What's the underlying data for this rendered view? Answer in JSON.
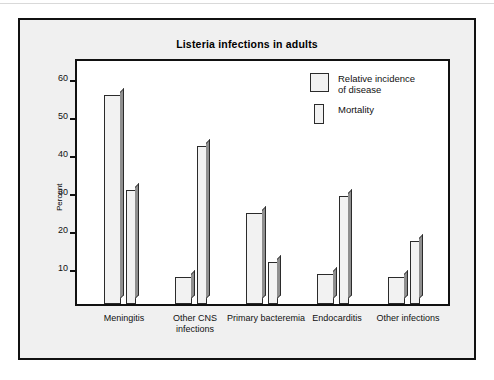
{
  "figure": {
    "title": "Listeria infections in adults"
  },
  "chart_data": {
    "type": "bar",
    "title": "Listeria infections in adults",
    "xlabel": "",
    "ylabel": "Percent",
    "ylim": [
      0,
      65
    ],
    "yticks": [
      10,
      20,
      30,
      40,
      50,
      60
    ],
    "grid": false,
    "legend_position": "top-right",
    "categories": [
      "Meningitis",
      "Other CNS infections",
      "Primary bacteremia",
      "Endocarditis",
      "Other infections"
    ],
    "category_labels": [
      "Meningitis",
      "Other CNS\ninfections",
      "Primary\nbacteremia",
      "Endocarditis",
      "Other\ninfections"
    ],
    "series": [
      {
        "name": "Relative incidence of disease",
        "legend_label": "Relative incidence\nof disease",
        "values": [
          55,
          7,
          24,
          8,
          7
        ]
      },
      {
        "name": "Mortality",
        "legend_label": "Mortality",
        "values": [
          30,
          41.5,
          11,
          28.5,
          16.5
        ]
      }
    ]
  },
  "colors": {
    "panel_background": "#f0f0f0",
    "plot_background": "#ffffff",
    "bar_face": "#f2f2f2",
    "bar_shadow": "#8f8f8f",
    "outline": "#111111"
  }
}
